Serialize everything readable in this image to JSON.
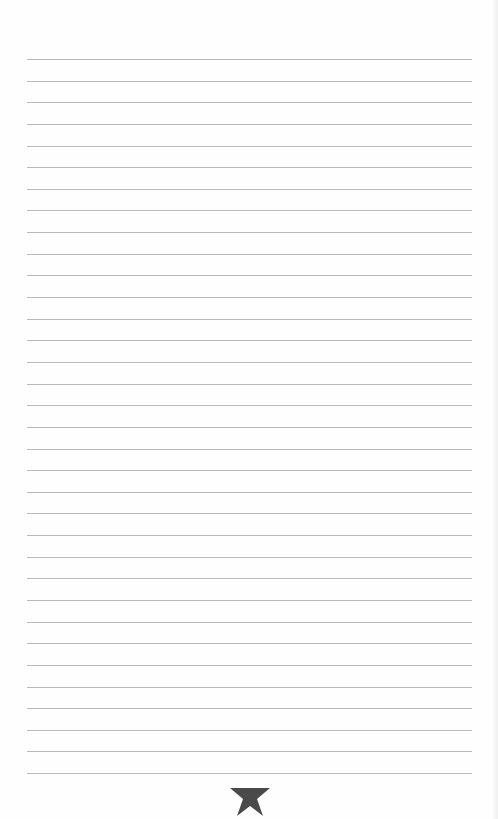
{
  "page": {
    "type": "lined-notepaper",
    "background_color": "#fefefe",
    "rule_color": "#b9b9b9",
    "rule_count": 34,
    "rule_first_y": 59,
    "rule_spacing": 21.64,
    "rule_left": 27,
    "rule_width": 445
  },
  "footer": {
    "ornament": "star-icon",
    "ornament_color": "#4a4a4a"
  }
}
